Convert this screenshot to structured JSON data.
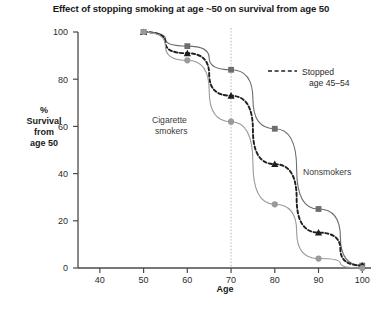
{
  "chart_data": {
    "type": "line",
    "title": "Effect of stopping smoking at age ~50 on survival from age 50",
    "xlabel": "Age",
    "ylabel": "% Survival from age 50",
    "ylabel_lines": [
      "%",
      "Survival",
      "from",
      "age 50"
    ],
    "xlim": [
      35,
      102
    ],
    "ylim": [
      0,
      100
    ],
    "xticks": [
      40,
      50,
      60,
      70,
      80,
      90,
      100
    ],
    "yticks": [
      0,
      20,
      40,
      60,
      80,
      100
    ],
    "grid": false,
    "legend_position": "right-top",
    "x": [
      50,
      60,
      70,
      80,
      90,
      100
    ],
    "series": [
      {
        "name": "Nonsmokers",
        "values": [
          100,
          94,
          84,
          59,
          25,
          1
        ],
        "marker": "square",
        "color": "#6d6d6d",
        "line_style": "solid",
        "label_text": "Nonsmokers",
        "label_x": 93,
        "label_y": 42
      },
      {
        "name": "Stopped age 45-54",
        "values": [
          100,
          91,
          73,
          44,
          15,
          1
        ],
        "marker": "triangle",
        "color": "#1f1f1f",
        "line_style": "dashed",
        "label_text": "Stopped age 45–54"
      },
      {
        "name": "Cigarette smokers",
        "values": [
          100,
          88,
          62,
          27,
          4,
          0
        ],
        "marker": "circle",
        "color": "#9a9a9a",
        "line_style": "solid",
        "label_text": "Cigarette smokers",
        "label_x": 62,
        "label_y": 55
      }
    ],
    "annotations": [
      {
        "name": "reference-line-age-70",
        "type": "vline",
        "x": 70,
        "style": "dotted"
      }
    ],
    "legend": [
      {
        "line1": "Stopped",
        "line2": "age 45–54",
        "style": "dashed"
      }
    ]
  },
  "colors": {
    "axis": "#4a4a4a",
    "nonsmokers": "#6d6d6d",
    "stopped": "#1f1f1f",
    "smokers": "#9a9a9a",
    "reference_line": "#b9b9b9",
    "text": "#231f20"
  }
}
